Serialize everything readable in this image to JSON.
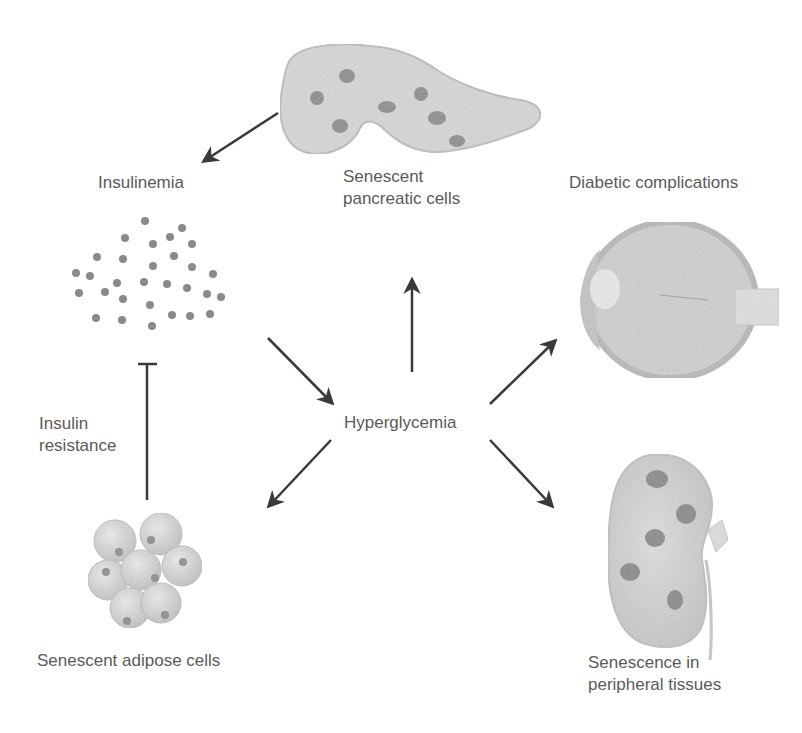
{
  "diagram": {
    "type": "flow-diagram",
    "theme_colors": {
      "background": "#ffffff",
      "text": "#5a5a5a",
      "arrow": "#3a3a3a",
      "tissue_fill": "#d6d6d6",
      "tissue_outline": "#b4b4b4",
      "senescent_spot": "#8c8c8c"
    },
    "center": {
      "label": "Hyperglycemia"
    },
    "nodes": {
      "pancreas": {
        "label": "Senescent\npancreatic cells",
        "icon": "pancreas-icon"
      },
      "insulinemia": {
        "label": "Insulinemia",
        "icon": "insulin-particles-icon"
      },
      "insulin_resistance": {
        "label": "Insulin\nresistance"
      },
      "adipose": {
        "label": "Senescent adipose cells",
        "icon": "adipose-cells-icon"
      },
      "complications": {
        "label": "Diabetic complications",
        "icon": "eye-icon"
      },
      "peripheral": {
        "label": "Senescence in\nperipheral tissues",
        "icon": "kidney-icon"
      }
    },
    "edges": [
      {
        "from": "Senescent pancreatic cells",
        "to": "Insulinemia",
        "type": "activation"
      },
      {
        "from": "Insulinemia",
        "to": "Hyperglycemia",
        "type": "activation"
      },
      {
        "from": "Hyperglycemia",
        "to": "Senescent pancreatic cells",
        "type": "activation"
      },
      {
        "from": "Hyperglycemia",
        "to": "Diabetic complications",
        "type": "activation"
      },
      {
        "from": "Hyperglycemia",
        "to": "Senescent adipose cells",
        "type": "activation"
      },
      {
        "from": "Hyperglycemia",
        "to": "Senescence in peripheral tissues",
        "type": "activation"
      },
      {
        "from": "Senescent adipose cells",
        "to": "Insulinemia",
        "type": "inhibition",
        "label": "Insulin resistance"
      }
    ]
  }
}
